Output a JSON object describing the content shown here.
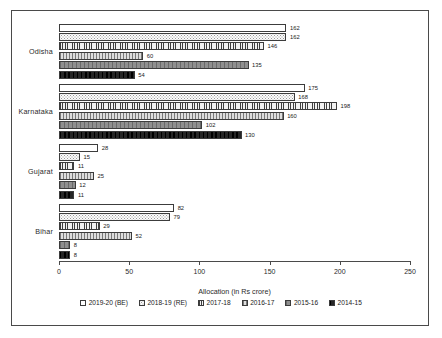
{
  "chart_data": {
    "type": "bar",
    "orientation": "horizontal",
    "title": "",
    "xlabel": "Allocation (in Rs crore)",
    "ylabel": "",
    "xlim": [
      0,
      250
    ],
    "xticks": [
      0,
      50,
      100,
      150,
      200,
      250
    ],
    "grid": false,
    "legend_position": "bottom",
    "categories": [
      "Odisha",
      "Karnataka",
      "Gujarat",
      "Bihar"
    ],
    "series": [
      {
        "name": "2019-20 (BE)",
        "values": [
          162,
          175,
          28,
          82
        ]
      },
      {
        "name": "2018-19 (RE)",
        "values": [
          162,
          168,
          15,
          79
        ]
      },
      {
        "name": "2017-18",
        "values": [
          146,
          198,
          11,
          29
        ]
      },
      {
        "name": "2016-17",
        "values": [
          60,
          160,
          25,
          52
        ]
      },
      {
        "name": "2015-16",
        "values": [
          135,
          102,
          12,
          8
        ]
      },
      {
        "name": "2014-15",
        "values": [
          54,
          130,
          11,
          8
        ]
      }
    ]
  },
  "axis": {
    "x_title": "Allocation (in Rs crore)",
    "tick_labels": [
      "0",
      "50",
      "100",
      "150",
      "200",
      "250"
    ]
  },
  "legend": {
    "items": [
      {
        "label": "2019-20 (BE)"
      },
      {
        "label": "2018-19 (RE)"
      },
      {
        "label": "2017-18"
      },
      {
        "label": "2016-17"
      },
      {
        "label": "2015-16"
      },
      {
        "label": "2014-15"
      }
    ]
  }
}
